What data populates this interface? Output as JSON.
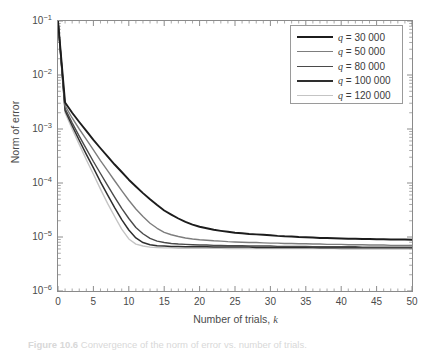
{
  "figure": {
    "ylabel": "Norm of error",
    "xlabel_text": "Number of trials, ",
    "xlabel_var": "k",
    "caption_label": "Figure 10.6",
    "caption_rest": " Convergence of the norm of error vs. number of trials."
  },
  "legend": {
    "items": [
      {
        "label_var": "q",
        "label_eq": " = 30 000",
        "color": "#1c1c1c",
        "width": 2.3
      },
      {
        "label_var": "q",
        "label_eq": " = 50 000",
        "color": "#7d7d7d",
        "width": 1.9
      },
      {
        "label_var": "q",
        "label_eq": " = 80 000",
        "color": "#4a4a4a",
        "width": 1.9
      },
      {
        "label_var": "q",
        "label_eq": " = 100 000",
        "color": "#2e2e2e",
        "width": 2.1
      },
      {
        "label_var": "q",
        "label_eq": " = 120 000",
        "color": "#c4c4c4",
        "width": 1.9
      }
    ]
  },
  "chart_data": {
    "type": "line",
    "title": "",
    "xlabel": "Number of trials, k",
    "ylabel": "Norm of error",
    "xlim": [
      0,
      50
    ],
    "ylim": [
      1e-06,
      0.1
    ],
    "yscale": "log",
    "xscale": "linear",
    "grid": false,
    "legend_position": "top-right",
    "xticks": [
      0,
      5,
      10,
      15,
      20,
      25,
      30,
      35,
      40,
      45,
      50
    ],
    "xtick_labels": [
      "0",
      "5",
      "10",
      "15",
      "20",
      "25",
      "30",
      "35",
      "40",
      "45",
      "50"
    ],
    "yticks": [
      1e-06,
      1e-05,
      0.0001,
      0.001,
      0.01,
      0.1
    ],
    "ytick_labels": [
      "10^-6",
      "10^-5",
      "10^-4",
      "10^-3",
      "10^-2",
      "10^-1"
    ],
    "x": [
      0,
      1,
      2,
      3,
      4,
      5,
      6,
      7,
      8,
      9,
      10,
      11,
      12,
      13,
      14,
      15,
      16,
      17,
      18,
      19,
      20,
      21,
      22,
      23,
      24,
      25,
      26,
      27,
      28,
      29,
      30,
      31,
      32,
      33,
      34,
      35,
      36,
      37,
      38,
      39,
      40,
      41,
      42,
      43,
      44,
      45,
      46,
      47,
      48,
      49,
      50
    ],
    "series": [
      {
        "name": "q = 30 000",
        "color": "#1c1c1c",
        "values": [
          0.1,
          0.0031,
          0.002,
          0.00135,
          0.00092,
          0.00063,
          0.00044,
          0.00031,
          0.00022,
          0.00016,
          0.000115,
          8.6e-05,
          6.5e-05,
          5e-05,
          3.9e-05,
          3.1e-05,
          2.6e-05,
          2.2e-05,
          1.9e-05,
          1.7e-05,
          1.55e-05,
          1.45e-05,
          1.36e-05,
          1.3e-05,
          1.25e-05,
          1.2e-05,
          1.17e-05,
          1.14e-05,
          1.12e-05,
          1.1e-05,
          1.08e-05,
          1.05e-05,
          1.03e-05,
          1.02e-05,
          1e-05,
          9.9e-06,
          9.8e-06,
          9.6e-06,
          9.6e-06,
          9.5e-06,
          9.4e-06,
          9.3e-06,
          9.3e-06,
          9.2e-06,
          9.2e-06,
          9.1e-06,
          9.1e-06,
          9e-06,
          9e-06,
          9e-06,
          8.9e-06
        ]
      },
      {
        "name": "q = 50 000",
        "color": "#7d7d7d",
        "values": [
          0.1,
          0.0027,
          0.0016,
          0.001,
          0.00064,
          0.00041,
          0.00026,
          0.00017,
          0.00011,
          7.2e-05,
          4.8e-05,
          3.3e-05,
          2.4e-05,
          1.8e-05,
          1.45e-05,
          1.22e-05,
          1.1e-05,
          1.02e-05,
          9.6e-06,
          9.2e-06,
          8.9e-06,
          8.7e-06,
          8.5e-06,
          8.4e-06,
          8.2e-06,
          8.1e-06,
          8e-06,
          7.9e-06,
          7.9e-06,
          7.8e-06,
          7.7e-06,
          7.7e-06,
          7.6e-06,
          7.6e-06,
          7.5e-06,
          7.5e-06,
          7.4e-06,
          7.4e-06,
          7.3e-06,
          7.3e-06,
          7.3e-06,
          7.2e-06,
          7.2e-06,
          7.2e-06,
          7.1e-06,
          7.1e-06,
          7.1e-06,
          7e-06,
          7e-06,
          7e-06,
          7e-06
        ]
      },
      {
        "name": "q = 80 000",
        "color": "#4a4a4a",
        "values": [
          0.1,
          0.0024,
          0.0013,
          0.00074,
          0.00043,
          0.00025,
          0.00015,
          9e-05,
          5.5e-05,
          3.4e-05,
          2.2e-05,
          1.5e-05,
          1.15e-05,
          9.4e-06,
          8.4e-06,
          7.9e-06,
          7.6e-06,
          7.4e-06,
          7.3e-06,
          7.2e-06,
          7.1e-06,
          7.1e-06,
          7e-06,
          7e-06,
          6.9e-06,
          6.9e-06,
          6.9e-06,
          6.8e-06,
          6.8e-06,
          6.8e-06,
          6.8e-06,
          6.7e-06,
          6.7e-06,
          6.7e-06,
          6.7e-06,
          6.7e-06,
          6.6e-06,
          6.6e-06,
          6.6e-06,
          6.6e-06,
          6.6e-06,
          6.6e-06,
          6.6e-06,
          6.5e-06,
          6.5e-06,
          6.5e-06,
          6.5e-06,
          6.5e-06,
          6.5e-06,
          6.5e-06,
          6.5e-06
        ]
      },
      {
        "name": "q = 100 000",
        "color": "#2e2e2e",
        "values": [
          0.1,
          0.0022,
          0.00115,
          0.00062,
          0.00034,
          0.00019,
          0.000105,
          6e-05,
          3.5e-05,
          2.1e-05,
          1.35e-05,
          9.6e-06,
          7.9e-06,
          7.2e-06,
          6.9e-06,
          6.8e-06,
          6.7e-06,
          6.7e-06,
          6.6e-06,
          6.6e-06,
          6.6e-06,
          6.6e-06,
          6.5e-06,
          6.5e-06,
          6.5e-06,
          6.5e-06,
          6.5e-06,
          6.5e-06,
          6.4e-06,
          6.4e-06,
          6.4e-06,
          6.4e-06,
          6.4e-06,
          6.4e-06,
          6.4e-06,
          6.4e-06,
          6.4e-06,
          6.3e-06,
          6.3e-06,
          6.3e-06,
          6.3e-06,
          6.3e-06,
          6.3e-06,
          6.3e-06,
          6.3e-06,
          6.3e-06,
          6.3e-06,
          6.3e-06,
          6.3e-06,
          6.3e-06,
          6.3e-06
        ]
      },
      {
        "name": "q = 120 000",
        "color": "#c4c4c4",
        "values": [
          0.1,
          0.002,
          0.001,
          0.00052,
          0.00027,
          0.000145,
          7.7e-05,
          4.2e-05,
          2.4e-05,
          1.4e-05,
          9.2e-06,
          7.4e-06,
          6.8e-06,
          6.5e-06,
          6.4e-06,
          6.3e-06,
          6.3e-06,
          6.2e-06,
          6.2e-06,
          6.2e-06,
          6.2e-06,
          6.2e-06,
          6.2e-06,
          6.2e-06,
          6.1e-06,
          6.1e-06,
          6.1e-06,
          6.1e-06,
          6.1e-06,
          6.1e-06,
          6.1e-06,
          6.1e-06,
          6.1e-06,
          6.1e-06,
          6.1e-06,
          6.1e-06,
          6.1e-06,
          6.1e-06,
          6.1e-06,
          6.1e-06,
          6e-06,
          6e-06,
          6e-06,
          6e-06,
          6e-06,
          6e-06,
          6e-06,
          6e-06,
          6e-06,
          6e-06,
          6e-06
        ]
      }
    ]
  }
}
